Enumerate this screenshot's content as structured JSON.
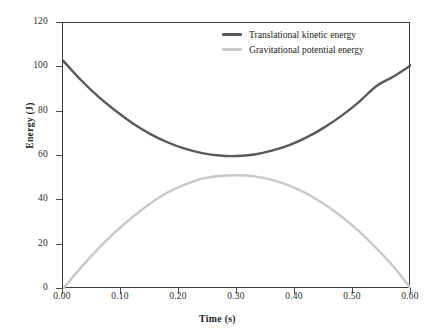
{
  "chart_data": {
    "type": "line",
    "title": "",
    "xlabel": "Time (s)",
    "ylabel": "Energy (J)",
    "xlim": [
      0.0,
      0.6
    ],
    "ylim": [
      0,
      120
    ],
    "grid": false,
    "legend_position": "top-right",
    "xticks": [
      "0.00",
      "0.10",
      "0.20",
      "0.30",
      "0.40",
      "0.50",
      "0.60"
    ],
    "xtick_values": [
      0.0,
      0.1,
      0.2,
      0.3,
      0.4,
      0.5,
      0.6
    ],
    "yticks": [
      "0",
      "20",
      "40",
      "60",
      "80",
      "100",
      "120"
    ],
    "ytick_values": [
      0,
      20,
      40,
      60,
      80,
      100,
      120
    ],
    "x": [
      0.0,
      0.03,
      0.06,
      0.09,
      0.12,
      0.15,
      0.18,
      0.21,
      0.24,
      0.27,
      0.3,
      0.33,
      0.36,
      0.39,
      0.42,
      0.45,
      0.48,
      0.51,
      0.54,
      0.57,
      0.6
    ],
    "series": [
      {
        "name": "Translational kinetic energy",
        "color": "#5a5a5a",
        "values": [
          103.0,
          94.5,
          87.0,
          80.5,
          74.8,
          70.0,
          66.2,
          63.3,
          61.3,
          60.2,
          60.0,
          60.7,
          62.4,
          64.9,
          68.4,
          72.8,
          78.1,
          84.3,
          91.5,
          95.9,
          101.0
        ]
      },
      {
        "name": "Gravitational potential energy",
        "color": "#c8c8c8",
        "values": [
          0.0,
          9.4,
          18.0,
          25.7,
          32.5,
          38.5,
          43.5,
          47.1,
          49.8,
          51.0,
          51.3,
          50.8,
          49.2,
          46.6,
          43.0,
          38.3,
          32.7,
          26.1,
          18.5,
          10.0,
          0.0
        ]
      }
    ]
  },
  "legend": {
    "items": [
      {
        "label": "Translational kinetic energy",
        "color": "#5a5a5a"
      },
      {
        "label": "Gravitational potential energy",
        "color": "#c8c8c8"
      }
    ]
  },
  "axes": {
    "x_title": "Time (s)",
    "y_title": "Energy (J)"
  }
}
